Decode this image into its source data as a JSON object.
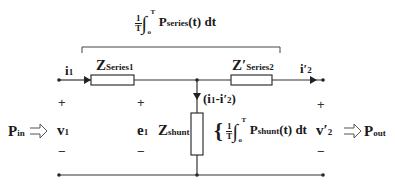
{
  "diagram": {
    "series_power_label": {
      "prefix_num": "1",
      "prefix_den": "T",
      "upper_limit": "T",
      "lower_limit": "o",
      "symbol": "P",
      "subscript": "series",
      "suffix": "(t) dt"
    },
    "components": {
      "z_series1": {
        "symbol": "Z",
        "subscript": "Series1"
      },
      "z_series2": {
        "symbol": "Z′",
        "subscript": "Series2"
      },
      "z_shunt": {
        "symbol": "Z",
        "subscript": "shunt"
      }
    },
    "currents": {
      "i1": {
        "symbol": "i",
        "subscript": "1"
      },
      "i2": {
        "symbol": "i′",
        "subscript": "2"
      },
      "shunt_current": "(i1-i′2)",
      "shunt_current_parts": {
        "open": "(i",
        "s1": "1",
        "mid": "-i′",
        "s2": "2",
        "close": ")"
      }
    },
    "voltages": {
      "v1": {
        "symbol": "v",
        "subscript": "1"
      },
      "e1": {
        "symbol": "e",
        "subscript": "1"
      },
      "v2": {
        "symbol": "v′",
        "subscript": "2"
      },
      "plus": "+",
      "minus": "−"
    },
    "powers": {
      "p_in": {
        "symbol": "P",
        "subscript": "in"
      },
      "p_out": {
        "symbol": "P",
        "subscript": "out"
      },
      "shunt_power_label": {
        "prefix_num": "1",
        "prefix_den": "T",
        "upper_limit": "T",
        "lower_limit": "o",
        "symbol": "P",
        "subscript": "shunt",
        "suffix": "(t) dt"
      },
      "brace": "{"
    },
    "colors": {
      "wire": "#333333",
      "text": "#1a1a1a",
      "background": "#ffffff"
    }
  }
}
